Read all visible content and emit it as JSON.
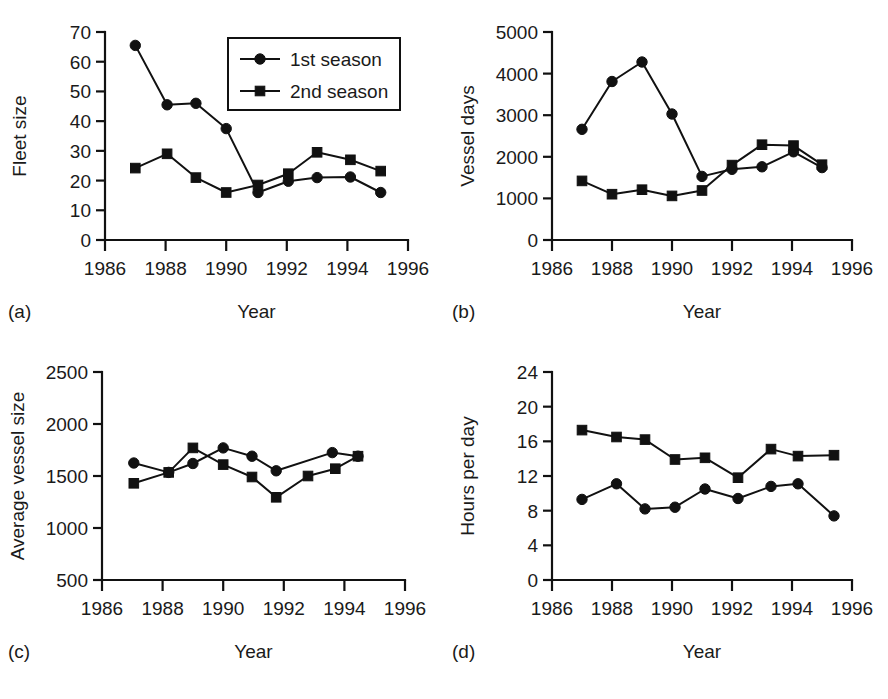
{
  "figure": {
    "background": "#ffffff",
    "ink_color": "#111111",
    "panel_count": 4
  },
  "legend": {
    "position": "panel-a-top-right",
    "entries": [
      {
        "label": "1st season",
        "marker": "circle-marker-icon"
      },
      {
        "label": "2nd season",
        "marker": "square-marker-icon"
      }
    ]
  },
  "caption": {
    "clipped_text": ""
  },
  "chart_data": [
    {
      "type": "line",
      "panel": "(a)",
      "title": "",
      "xlabel": "Year",
      "ylabel": "Fleet size",
      "xlim": [
        1986,
        1996
      ],
      "ylim": [
        0,
        70
      ],
      "xticks": [
        1986,
        1988,
        1990,
        1992,
        1994,
        1996
      ],
      "yticks": [
        0,
        10,
        20,
        30,
        40,
        50,
        60,
        70
      ],
      "xticklabels": [
        "1986",
        "1988",
        "1990",
        "1992",
        "1994",
        "1996"
      ],
      "yticklabels": [
        "0",
        "10",
        "20",
        "30",
        "40",
        "50",
        "60",
        "70"
      ],
      "grid": false,
      "legend": "upper-right",
      "series": [
        {
          "name": "1st season",
          "marker": "circle",
          "x": [
            1987.0,
            1988.05,
            1989.0,
            1990.0,
            1991.05,
            1992.05,
            1993.0,
            1994.1,
            1995.1
          ],
          "values": [
            65.5,
            45.5,
            46.0,
            37.5,
            16.0,
            19.8,
            21.0,
            21.2,
            16.0
          ]
        },
        {
          "name": "2nd season",
          "marker": "square",
          "x": [
            1987.0,
            1988.05,
            1989.0,
            1990.0,
            1991.05,
            1992.05,
            1993.0,
            1994.1,
            1995.1
          ],
          "values": [
            24.2,
            29.0,
            21.0,
            16.0,
            18.5,
            22.3,
            29.5,
            27.0,
            23.2
          ]
        }
      ]
    },
    {
      "type": "line",
      "panel": "(b)",
      "title": "",
      "xlabel": "Year",
      "ylabel": "Vessel days",
      "xlim": [
        1986,
        1996
      ],
      "ylim": [
        0,
        5000
      ],
      "xticks": [
        1986,
        1988,
        1990,
        1992,
        1994,
        1996
      ],
      "yticks": [
        0,
        1000,
        2000,
        3000,
        4000,
        5000
      ],
      "xticklabels": [
        "1986",
        "1988",
        "1990",
        "1992",
        "1994",
        "1996"
      ],
      "yticklabels": [
        "0",
        "1000",
        "2000",
        "3000",
        "4000",
        "5000"
      ],
      "grid": false,
      "legend": "none",
      "series": [
        {
          "name": "1st season",
          "marker": "circle",
          "x": [
            1987.0,
            1988.0,
            1989.0,
            1990.0,
            1991.0,
            1992.0,
            1993.0,
            1994.05,
            1995.0
          ],
          "values": [
            2660,
            3810,
            4280,
            3030,
            1530,
            1700,
            1760,
            2120,
            1740
          ]
        },
        {
          "name": "2nd season",
          "marker": "square",
          "x": [
            1987.0,
            1988.0,
            1989.0,
            1990.0,
            1991.0,
            1992.0,
            1993.0,
            1994.05,
            1995.0
          ],
          "values": [
            1420,
            1100,
            1210,
            1060,
            1190,
            1800,
            2290,
            2270,
            1810
          ]
        }
      ]
    },
    {
      "type": "line",
      "panel": "(c)",
      "title": "",
      "xlabel": "Year",
      "ylabel": "Average vessel size",
      "xlim": [
        1986,
        1996
      ],
      "ylim": [
        500,
        2500
      ],
      "xticks": [
        1986,
        1988,
        1990,
        1992,
        1994,
        1996
      ],
      "yticks": [
        500,
        1000,
        1500,
        2000,
        2500
      ],
      "xticklabels": [
        "1986",
        "1988",
        "1990",
        "1992",
        "1994",
        "1996"
      ],
      "yticklabels": [
        "500",
        "1000",
        "1500",
        "2000",
        "2500"
      ],
      "grid": false,
      "legend": "none",
      "series": [
        {
          "name": "1st season",
          "marker": "circle",
          "x": [
            1987.05,
            1988.2,
            1989.0,
            1990.0,
            1990.95,
            1991.75,
            1993.6,
            1994.45
          ],
          "values": [
            1625,
            1535,
            1620,
            1770,
            1690,
            1550,
            1725,
            1690
          ]
        },
        {
          "name": "2nd season",
          "marker": "square",
          "x": [
            1987.05,
            1988.2,
            1989.0,
            1990.0,
            1990.95,
            1991.75,
            1992.8,
            1993.7,
            1994.45
          ],
          "values": [
            1430,
            1535,
            1770,
            1610,
            1490,
            1295,
            1500,
            1570,
            1690
          ]
        }
      ]
    },
    {
      "type": "line",
      "panel": "(d)",
      "title": "",
      "xlabel": "Year",
      "ylabel": "Hours per day",
      "xlim": [
        1986,
        1996
      ],
      "ylim": [
        0,
        24
      ],
      "xticks": [
        1986,
        1988,
        1990,
        1992,
        1994,
        1996
      ],
      "yticks": [
        0,
        4,
        8,
        12,
        16,
        20,
        24
      ],
      "xticklabels": [
        "1986",
        "1988",
        "1990",
        "1992",
        "1994",
        "1996"
      ],
      "yticklabels": [
        "0",
        "4",
        "8",
        "12",
        "16",
        "20",
        "24"
      ],
      "grid": false,
      "legend": "none",
      "series": [
        {
          "name": "1st season",
          "marker": "circle",
          "x": [
            1987.0,
            1988.15,
            1989.1,
            1990.1,
            1991.1,
            1992.2,
            1993.3,
            1994.2,
            1995.4
          ],
          "values": [
            9.3,
            11.1,
            8.2,
            8.4,
            10.5,
            9.4,
            10.8,
            11.1,
            7.4
          ]
        },
        {
          "name": "2nd season",
          "marker": "square",
          "x": [
            1987.0,
            1988.15,
            1989.1,
            1990.1,
            1991.1,
            1992.2,
            1993.3,
            1994.2,
            1995.4
          ],
          "values": [
            17.3,
            16.5,
            16.2,
            13.9,
            14.1,
            11.8,
            15.1,
            14.3,
            14.4
          ]
        }
      ]
    }
  ]
}
